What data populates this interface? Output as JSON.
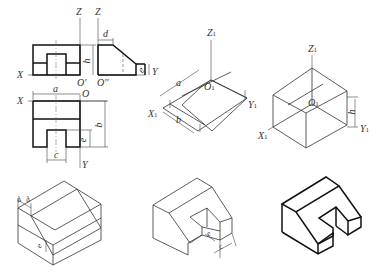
{
  "views": {
    "front_view": {
      "axis_x": "X",
      "axis_z": "Z",
      "origin": "O'",
      "dim_h": "h"
    },
    "side_view": {
      "axis_z": "Z",
      "axis_y": "Y",
      "origin": "O''",
      "dim_d": "d",
      "dim_e": "e"
    },
    "top_view": {
      "axis_x": "X",
      "axis_y": "Y",
      "origin": "O",
      "dim_a": "a",
      "dim_b": "b",
      "dim_c": "c",
      "dim_e": "e"
    }
  },
  "step1": {
    "axis_z": "Z",
    "axis_z_sub": "1",
    "axis_x": "X",
    "axis_x_sub": "1",
    "axis_y": "Y",
    "axis_y_sub": "1",
    "origin": "O",
    "origin_sub": "1",
    "dim_a": "a",
    "dim_b": "b"
  },
  "step2": {
    "axis_z": "Z",
    "axis_z_sub": "1",
    "axis_x": "X",
    "axis_x_sub": "1",
    "axis_y": "Y",
    "axis_y_sub": "1",
    "origin": "O",
    "origin_sub": "1",
    "dim_h": "h"
  },
  "step3": {
    "dim_d": "d",
    "dim_d2": "d",
    "dim_e": "e"
  },
  "step4": {
    "dim_e": "e",
    "dim_c": "c"
  },
  "step5": {
    "label": ""
  }
}
